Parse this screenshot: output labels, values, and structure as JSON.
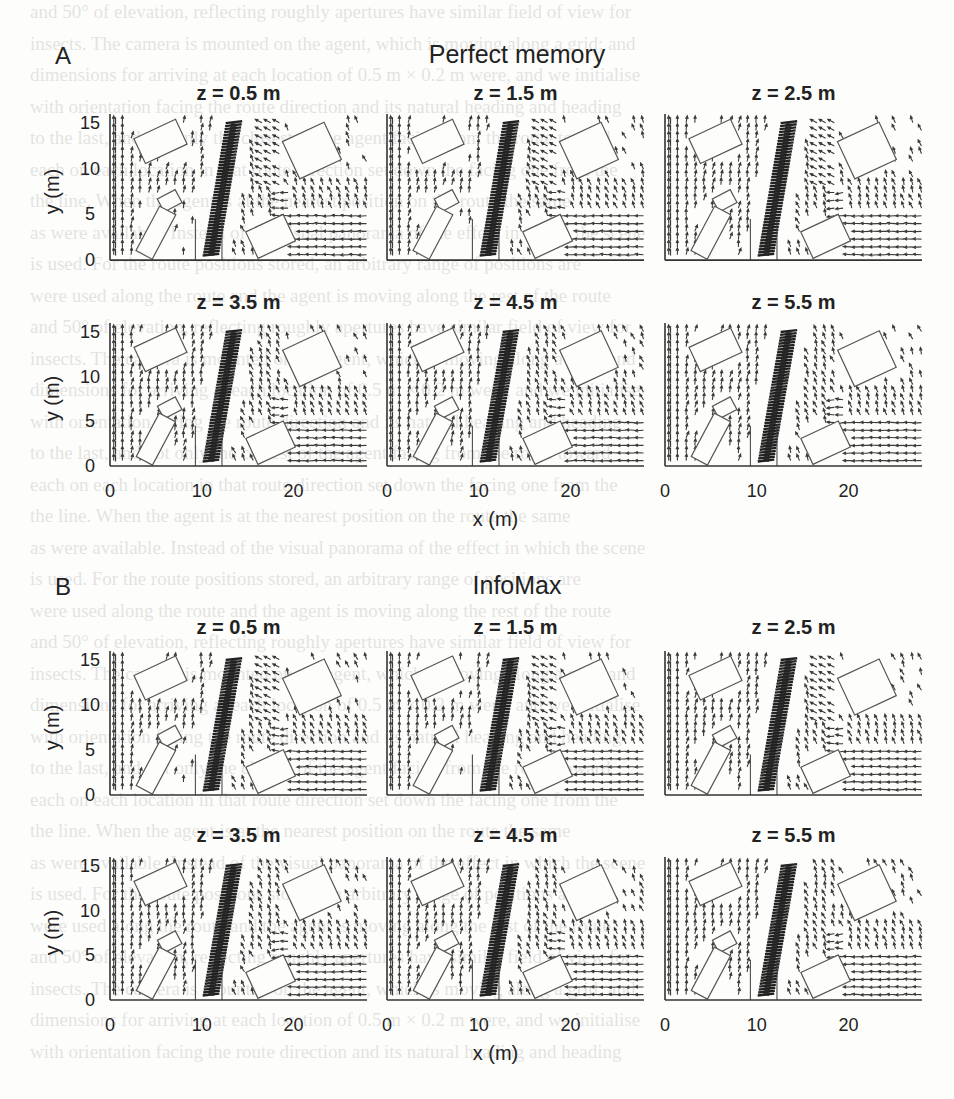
{
  "figure": {
    "background_text_lines": [
      "and 50° of elevation, reflecting roughly apertures have similar field of view for",
      "insects. The camera is mounted on the agent, which is moving along a grid; and",
      "dimensions for arriving at each location of 0.5 m × 0.2 m were, and we initialise",
      "with orientation facing the route direction and its natural heading and heading",
      "to the last, and not only the closest of the agent facing from the route toward",
      "each on each location in that route direction set down the facing one from the",
      "the line. When the agent is at the nearest position on the route the same",
      "as were available. Instead of the visual panorama of the effect in which the scene",
      "is used. For the route positions stored, an arbitrary range of positions are",
      "were used along the route and the agent is moving along the rest of the route"
    ],
    "panel_a": {
      "letter": "A",
      "title": "Perfect memory"
    },
    "panel_b": {
      "letter": "B",
      "title": "InfoMax"
    },
    "axis": {
      "ylabel": "y (m)",
      "xlabel": "x (m)",
      "xticks": [
        "0",
        "10",
        "20"
      ],
      "yticks": [
        "0",
        "5",
        "10",
        "15"
      ]
    },
    "subplots_a": [
      {
        "label": "z = 0.5 m"
      },
      {
        "label": "z = 1.5 m"
      },
      {
        "label": "z = 2.5 m"
      },
      {
        "label": "z = 3.5 m"
      },
      {
        "label": "z = 4.5 m"
      },
      {
        "label": "z = 5.5 m"
      }
    ],
    "subplots_b": [
      {
        "label": "z = 0.5 m"
      },
      {
        "label": "z = 1.5 m"
      },
      {
        "label": "z = 2.5 m"
      },
      {
        "label": "z = 3.5 m"
      },
      {
        "label": "z = 4.5 m"
      },
      {
        "label": "z = 5.5 m"
      }
    ]
  },
  "chart_data": {
    "type": "quiver",
    "xlabel": "x (m)",
    "ylabel": "y (m)",
    "xlim": [
      0,
      28
    ],
    "ylim": [
      0,
      16
    ],
    "xticks": [
      0,
      10,
      20
    ],
    "yticks": [
      0,
      5,
      10,
      15
    ],
    "grid": false,
    "route": {
      "description": "dense dark arrows along diagonal route",
      "start": [
        11,
        0.5
      ],
      "end": [
        13.5,
        15
      ]
    },
    "obstacles": [
      {
        "name": "box-top-left",
        "cx": 5.5,
        "cy": 13,
        "w": 5,
        "h": 3,
        "angle": -25
      },
      {
        "name": "box-small-middle",
        "cx": 6.5,
        "cy": 6.5,
        "w": 2.2,
        "h": 1.6,
        "angle": -28
      },
      {
        "name": "box-tall-bottom-left",
        "cx": 5.0,
        "cy": 3.0,
        "w": 2,
        "h": 5.5,
        "angle": 28
      },
      {
        "name": "box-bottom-center",
        "cx": 17.5,
        "cy": 2.6,
        "w": 4.5,
        "h": 3.2,
        "angle": -25
      },
      {
        "name": "box-top-right",
        "cx": 22,
        "cy": 12,
        "w": 5,
        "h": 4.5,
        "angle": -25
      }
    ],
    "panels": [
      {
        "method": "Perfect memory",
        "z": 0.5
      },
      {
        "method": "Perfect memory",
        "z": 1.5
      },
      {
        "method": "Perfect memory",
        "z": 2.5
      },
      {
        "method": "Perfect memory",
        "z": 3.5
      },
      {
        "method": "Perfect memory",
        "z": 4.5
      },
      {
        "method": "Perfect memory",
        "z": 5.5
      },
      {
        "method": "InfoMax",
        "z": 0.5
      },
      {
        "method": "InfoMax",
        "z": 1.5
      },
      {
        "method": "InfoMax",
        "z": 2.5
      },
      {
        "method": "InfoMax",
        "z": 3.5
      },
      {
        "method": "InfoMax",
        "z": 4.5
      },
      {
        "method": "InfoMax",
        "z": 5.5
      }
    ],
    "colors": {
      "arrows": "#3a3a3a",
      "route": "#222222",
      "obstacles": "#555555",
      "axes": "#333333"
    }
  }
}
